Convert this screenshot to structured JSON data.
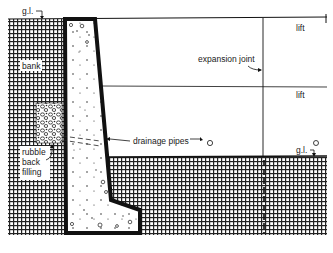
{
  "diagram": {
    "type": "retaining-wall-section",
    "labels": {
      "ground_level_top": "g.l.",
      "ground_level_bottom": "g.l.",
      "bank": "bank",
      "expansion_joint": "expansion joint",
      "lift_top": "lift",
      "lift_middle": "lift",
      "drainage_pipes": "drainage pipes",
      "rubble_line1": "rubble",
      "rubble_line2": "back",
      "rubble_line3": "filling"
    },
    "colors": {
      "ink": "#111111",
      "paper": "#ffffff"
    }
  }
}
